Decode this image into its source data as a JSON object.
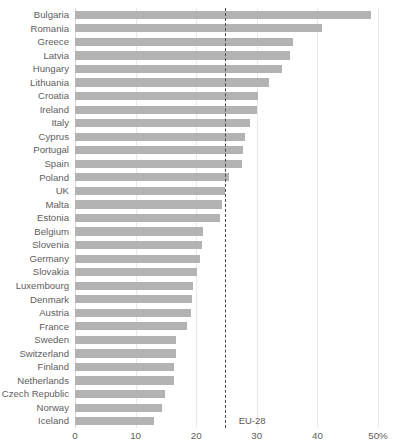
{
  "chart_data": {
    "type": "bar",
    "orientation": "horizontal",
    "title": "",
    "subtitle": "",
    "xlabel": "",
    "ylabel": "",
    "xlim": [
      0,
      50
    ],
    "grid": true,
    "legend": false,
    "unit": "%",
    "categories": [
      "Bulgaria",
      "Romania",
      "Greece",
      "Latvia",
      "Hungary",
      "Lithuania",
      "Croatia",
      "Ireland",
      "Italy",
      "Cyprus",
      "Portugal",
      "Spain",
      "Poland",
      "UK",
      "Malta",
      "Estonia",
      "Belgium",
      "Slovenia",
      "Germany",
      "Slovakia",
      "Luxembourg",
      "Denmark",
      "Austria",
      "France",
      "Sweden",
      "Switzerland",
      "Finland",
      "Netherlands",
      "Czech Republic",
      "Norway",
      "Iceland"
    ],
    "values": [
      48.8,
      40.7,
      36.0,
      35.5,
      34.1,
      32.0,
      30.2,
      30.0,
      28.9,
      28.0,
      27.8,
      27.5,
      25.4,
      24.8,
      24.2,
      24.0,
      21.1,
      20.9,
      20.7,
      20.2,
      19.4,
      19.3,
      19.2,
      18.5,
      16.7,
      16.6,
      16.4,
      16.4,
      14.9,
      14.3,
      13.0
    ],
    "tick_labels": [
      "0",
      "10",
      "20",
      "30",
      "40",
      "50%"
    ],
    "tick_values": [
      0,
      10,
      20,
      30,
      40,
      50
    ],
    "reference_line": {
      "label": "EU-28",
      "value": 24.7,
      "style": "dashed",
      "color": "#4a4a4a"
    },
    "bar_color": "#b3b3b3",
    "grid_color": "#e9e9e9",
    "text_color": "#5e5e5e"
  }
}
